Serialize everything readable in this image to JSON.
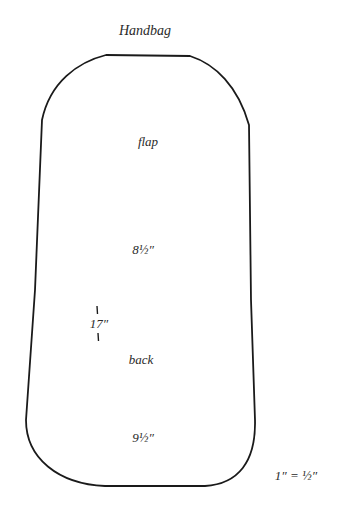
{
  "title": "Handbag",
  "pattern": {
    "sections": [
      {
        "label": "flap",
        "dimension": "8½″"
      },
      {
        "label": "back",
        "dimension": "9½″"
      }
    ],
    "total_length": "17″",
    "stroke_color": "#1a1a1a"
  },
  "scale_note": "1″ = ½″"
}
